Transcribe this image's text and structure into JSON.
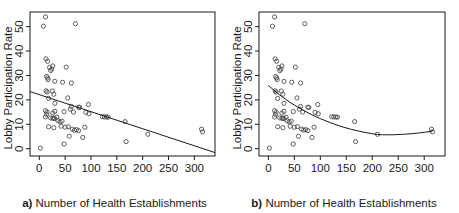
{
  "figure": {
    "panel_a": {
      "caption_prefix": "a)",
      "caption_text": "Number of Health Establishments",
      "ylabel": "Lobby Participation Rate"
    },
    "panel_b": {
      "caption_prefix": "b)",
      "caption_text": "Number of Health Establishments",
      "ylabel": "Lobby Participation Rate"
    }
  },
  "chart_data": [
    {
      "type": "scatter",
      "title": "",
      "panel": "a",
      "xlabel": "Number of Health Establishments",
      "ylabel": "Lobby Participation Rate",
      "xlim": [
        -18,
        340
      ],
      "ylim": [
        -3,
        56
      ],
      "xticks": [
        0,
        50,
        100,
        150,
        200,
        250,
        300
      ],
      "yticks": [
        0,
        10,
        20,
        30,
        40,
        50
      ],
      "grid": false,
      "legend": "none",
      "marker": "open-circle",
      "point_color": "#4d4d4d",
      "line_color": "#1a1a1a",
      "points": [
        [
          2,
          0.2
        ],
        [
          8,
          50.2
        ],
        [
          12,
          54.0
        ],
        [
          70,
          51.2
        ],
        [
          13,
          36.8
        ],
        [
          16,
          35.8
        ],
        [
          20,
          33.3
        ],
        [
          22,
          32.0
        ],
        [
          24,
          32.6
        ],
        [
          26,
          33.9
        ],
        [
          52,
          33.4
        ],
        [
          14,
          29.6
        ],
        [
          16,
          29.0
        ],
        [
          17,
          28.3
        ],
        [
          30,
          27.6
        ],
        [
          45,
          27.2
        ],
        [
          62,
          26.9
        ],
        [
          13,
          23.7
        ],
        [
          15,
          23.2
        ],
        [
          25,
          23.6
        ],
        [
          28,
          22.3
        ],
        [
          18,
          20.6
        ],
        [
          55,
          20.8
        ],
        [
          30,
          18.6
        ],
        [
          95,
          18.1
        ],
        [
          12,
          15.6
        ],
        [
          15,
          15.0
        ],
        [
          14,
          14.0
        ],
        [
          26,
          14.6
        ],
        [
          30,
          15.3
        ],
        [
          48,
          15.2
        ],
        [
          62,
          17.3
        ],
        [
          76,
          17.0
        ],
        [
          78,
          16.9
        ],
        [
          60,
          16.2
        ],
        [
          66,
          15.0
        ],
        [
          90,
          14.9
        ],
        [
          96,
          14.3
        ],
        [
          12,
          13.0
        ],
        [
          22,
          12.6
        ],
        [
          26,
          12.5
        ],
        [
          28,
          12.4
        ],
        [
          30,
          12.3
        ],
        [
          34,
          12.9
        ],
        [
          36,
          11.5
        ],
        [
          40,
          11.0
        ],
        [
          44,
          11.3
        ],
        [
          122,
          13.1
        ],
        [
          126,
          13.0
        ],
        [
          130,
          13.0
        ],
        [
          133,
          12.9
        ],
        [
          166,
          11.1
        ],
        [
          18,
          9.0
        ],
        [
          28,
          8.6
        ],
        [
          42,
          9.2
        ],
        [
          50,
          8.8
        ],
        [
          56,
          9.0
        ],
        [
          64,
          8.0
        ],
        [
          68,
          7.6
        ],
        [
          72,
          7.8
        ],
        [
          76,
          7.4
        ],
        [
          88,
          8.8
        ],
        [
          58,
          5.1
        ],
        [
          84,
          4.6
        ],
        [
          210,
          5.9
        ],
        [
          314,
          8.0
        ],
        [
          316,
          6.9
        ],
        [
          48,
          1.9
        ],
        [
          168,
          2.9
        ]
      ],
      "fit": {
        "type": "linear",
        "description": "ordinary least squares regression line",
        "x_start": -18,
        "y_start": 23.4,
        "x_end": 340,
        "y_end": -1.6
      }
    },
    {
      "type": "scatter",
      "title": "",
      "panel": "b",
      "xlabel": "Number of Health Establishments",
      "ylabel": "Lobby Participation Rate",
      "xlim": [
        -18,
        340
      ],
      "ylim": [
        -3,
        56
      ],
      "xticks": [
        0,
        50,
        100,
        150,
        200,
        250,
        300
      ],
      "yticks": [
        0,
        10,
        20,
        30,
        40,
        50
      ],
      "grid": false,
      "legend": "none",
      "marker": "open-circle",
      "point_color": "#4d4d4d",
      "line_color": "#1a1a1a",
      "points": [
        [
          2,
          0.2
        ],
        [
          8,
          50.2
        ],
        [
          12,
          54.0
        ],
        [
          70,
          51.2
        ],
        [
          13,
          36.8
        ],
        [
          16,
          35.8
        ],
        [
          20,
          33.3
        ],
        [
          22,
          32.0
        ],
        [
          24,
          32.6
        ],
        [
          26,
          33.9
        ],
        [
          52,
          33.4
        ],
        [
          14,
          29.6
        ],
        [
          16,
          29.0
        ],
        [
          17,
          28.3
        ],
        [
          30,
          27.6
        ],
        [
          45,
          27.2
        ],
        [
          62,
          26.9
        ],
        [
          13,
          23.7
        ],
        [
          15,
          23.2
        ],
        [
          25,
          23.6
        ],
        [
          28,
          22.3
        ],
        [
          18,
          20.6
        ],
        [
          55,
          20.8
        ],
        [
          30,
          18.6
        ],
        [
          95,
          18.1
        ],
        [
          12,
          15.6
        ],
        [
          15,
          15.0
        ],
        [
          14,
          14.0
        ],
        [
          26,
          14.6
        ],
        [
          30,
          15.3
        ],
        [
          48,
          15.2
        ],
        [
          62,
          17.3
        ],
        [
          76,
          17.0
        ],
        [
          78,
          16.9
        ],
        [
          60,
          16.2
        ],
        [
          66,
          15.0
        ],
        [
          90,
          14.9
        ],
        [
          96,
          14.3
        ],
        [
          12,
          13.0
        ],
        [
          22,
          12.6
        ],
        [
          26,
          12.5
        ],
        [
          28,
          12.4
        ],
        [
          30,
          12.3
        ],
        [
          34,
          12.9
        ],
        [
          36,
          11.5
        ],
        [
          40,
          11.0
        ],
        [
          44,
          11.3
        ],
        [
          122,
          13.1
        ],
        [
          126,
          13.0
        ],
        [
          130,
          13.0
        ],
        [
          133,
          12.9
        ],
        [
          166,
          11.1
        ],
        [
          18,
          9.0
        ],
        [
          28,
          8.6
        ],
        [
          42,
          9.2
        ],
        [
          50,
          8.8
        ],
        [
          56,
          9.0
        ],
        [
          64,
          8.0
        ],
        [
          68,
          7.6
        ],
        [
          72,
          7.8
        ],
        [
          76,
          7.4
        ],
        [
          88,
          8.8
        ],
        [
          58,
          5.1
        ],
        [
          84,
          4.6
        ],
        [
          210,
          5.9
        ],
        [
          314,
          8.0
        ],
        [
          316,
          6.9
        ],
        [
          48,
          1.9
        ],
        [
          168,
          2.9
        ]
      ],
      "fit": {
        "type": "quadratic",
        "description": "fitted curve with minimum near x=210",
        "curve_points": [
          [
            0,
            25.9
          ],
          [
            20,
            22.3
          ],
          [
            40,
            19.2
          ],
          [
            60,
            16.6
          ],
          [
            80,
            14.3
          ],
          [
            100,
            12.3
          ],
          [
            120,
            10.6
          ],
          [
            140,
            9.1
          ],
          [
            160,
            7.9
          ],
          [
            180,
            6.9
          ],
          [
            200,
            6.1
          ],
          [
            210,
            5.8
          ],
          [
            220,
            5.7
          ],
          [
            240,
            5.7
          ],
          [
            260,
            5.9
          ],
          [
            280,
            6.2
          ],
          [
            300,
            6.7
          ],
          [
            316,
            7.2
          ]
        ]
      }
    }
  ]
}
